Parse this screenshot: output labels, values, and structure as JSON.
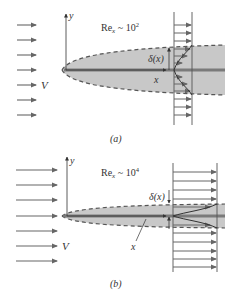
{
  "panels": [
    {
      "id": "a",
      "caption": "(a)",
      "reynolds_label": "Re",
      "reynolds_sub": "x",
      "reynolds_rel": " ~ 10",
      "reynolds_exp": "2",
      "y_axis_label": "y",
      "x_axis_label": "x",
      "freestream_label": "V",
      "thickness_label": "δ(x)"
    },
    {
      "id": "b",
      "caption": "(b)",
      "reynolds_label": "Re",
      "reynolds_sub": "x",
      "reynolds_rel": " ~ 10",
      "reynolds_exp": "4",
      "y_axis_label": "y",
      "x_axis_label": "x",
      "freestream_label": "V",
      "thickness_label": "δ(x)"
    }
  ],
  "colors": {
    "boundary_layer_fill": "#c8c8c8",
    "plate": "#7a7a7a",
    "arrow": "#666666",
    "dashed_edge": "#555555",
    "text": "#333333"
  }
}
